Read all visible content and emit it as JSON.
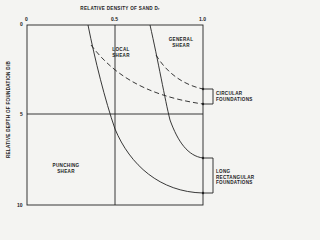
{
  "x_axis": {
    "title": "RELATIVE DENSITY OF SAND  Dᵣ",
    "ticks": [
      "0",
      "0.5",
      "1.0"
    ]
  },
  "y_axis": {
    "title": "RELATIVE DEPTH OF FOUNDATION D/B",
    "ticks": [
      "0",
      "5",
      "10"
    ]
  },
  "regions": {
    "local_shear": [
      "LOCAL",
      "SHEAR"
    ],
    "general_shear": [
      "GENERAL",
      "SHEAR"
    ],
    "punching_shear": [
      "PUNCHING",
      "SHEAR"
    ]
  },
  "annotations": {
    "circular": [
      "CIRCULAR",
      "FOUNDATIONS"
    ],
    "long_rect": [
      "LONG",
      "RECTANGULAR",
      "FOUNDATIONS"
    ]
  },
  "colors": {
    "line": "#222222",
    "background": "#f4f4f2"
  }
}
